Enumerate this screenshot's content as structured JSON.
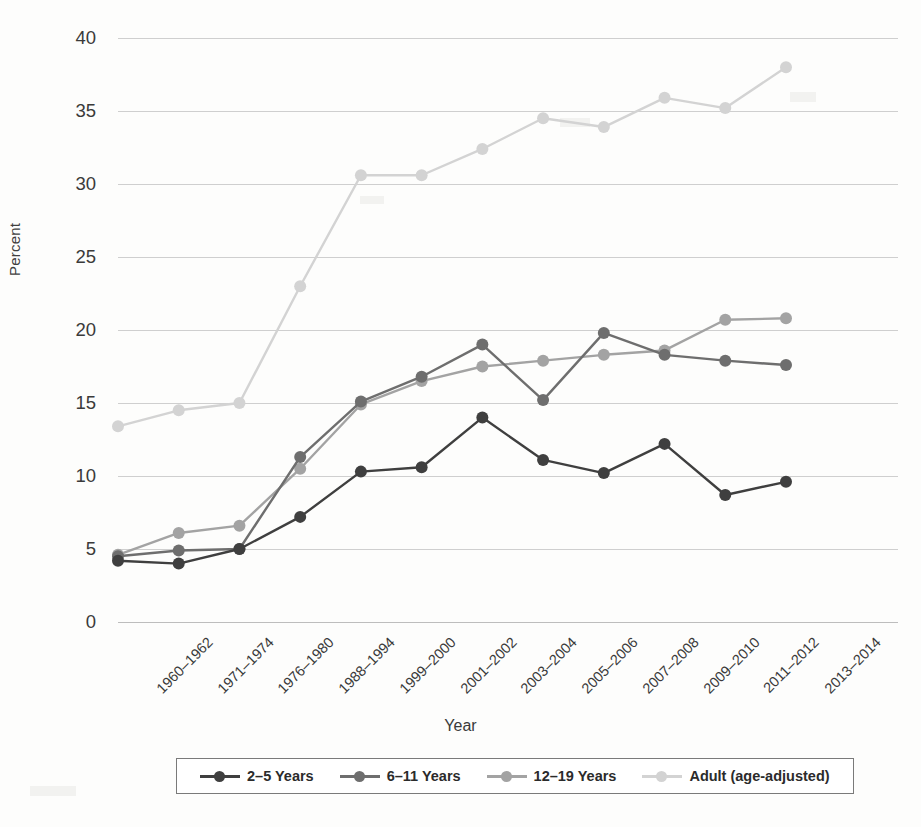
{
  "chart_data": {
    "type": "line",
    "title": "",
    "xlabel": "Year",
    "ylabel": "Percent",
    "ylim": [
      0,
      40
    ],
    "ytick_step": 5,
    "yticks": [
      "0",
      "5",
      "10",
      "15",
      "20",
      "25",
      "30",
      "35",
      "40"
    ],
    "grid": true,
    "legend_position": "bottom",
    "categories": [
      "1960–1962",
      "1971–1974",
      "1976–1980",
      "1988–1994",
      "1999–2000",
      "2001–2002",
      "2003–2004",
      "2005–2006",
      "2007–2008",
      "2009–2010",
      "2011–2012",
      "2013–2014"
    ],
    "series": [
      {
        "name": "2–5 Years",
        "color": "#3f3f3f",
        "values": [
          4.2,
          4.0,
          5.0,
          7.2,
          10.3,
          10.6,
          14.0,
          11.1,
          10.2,
          12.2,
          8.7,
          9.6
        ]
      },
      {
        "name": "6–11 Years",
        "color": "#6e6e6e",
        "values": [
          4.5,
          4.9,
          5.0,
          11.3,
          15.1,
          16.8,
          19.0,
          15.2,
          19.8,
          18.3,
          17.9,
          17.6
        ]
      },
      {
        "name": "12–19 Years",
        "color": "#a3a3a3",
        "values": [
          4.6,
          6.1,
          6.6,
          10.5,
          14.9,
          16.5,
          17.5,
          17.9,
          18.3,
          18.6,
          20.7,
          20.8
        ]
      },
      {
        "name": "Adult (age-adjusted)",
        "color": "#d3d3d3",
        "values": [
          13.4,
          14.5,
          15.0,
          23.0,
          30.6,
          30.6,
          32.4,
          34.5,
          33.9,
          35.9,
          35.2,
          38.0
        ]
      }
    ]
  },
  "axes": {
    "y_title": "Percent",
    "x_title": "Year"
  }
}
